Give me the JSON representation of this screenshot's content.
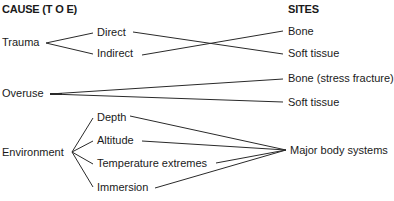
{
  "headers": {
    "cause": "CAUSE (T O E)",
    "sites": "SITES"
  },
  "causes": {
    "trauma": {
      "label": "Trauma",
      "subtypes": [
        "Direct",
        "Indirect"
      ]
    },
    "overuse": {
      "label": "Overuse"
    },
    "environment": {
      "label": "Environment",
      "subtypes": [
        "Depth",
        "Altitude",
        "Temperature extremes",
        "Immersion"
      ]
    }
  },
  "sites": {
    "trauma": [
      "Bone",
      "Soft tissue"
    ],
    "overuse": [
      "Bone (stress fracture)",
      "Soft tissue"
    ],
    "environment": [
      "Major body systems"
    ]
  },
  "connections": [
    {
      "from": "Direct",
      "to": "Soft tissue"
    },
    {
      "from": "Indirect",
      "to": "Bone"
    },
    {
      "from": "Overuse",
      "to": "Bone (stress fracture)"
    },
    {
      "from": "Overuse",
      "to": "Soft tissue"
    },
    {
      "from": "Depth",
      "to": "Major body systems"
    },
    {
      "from": "Altitude",
      "to": "Major body systems"
    },
    {
      "from": "Temperature extremes",
      "to": "Major body systems"
    },
    {
      "from": "Immersion",
      "to": "Major body systems"
    }
  ]
}
